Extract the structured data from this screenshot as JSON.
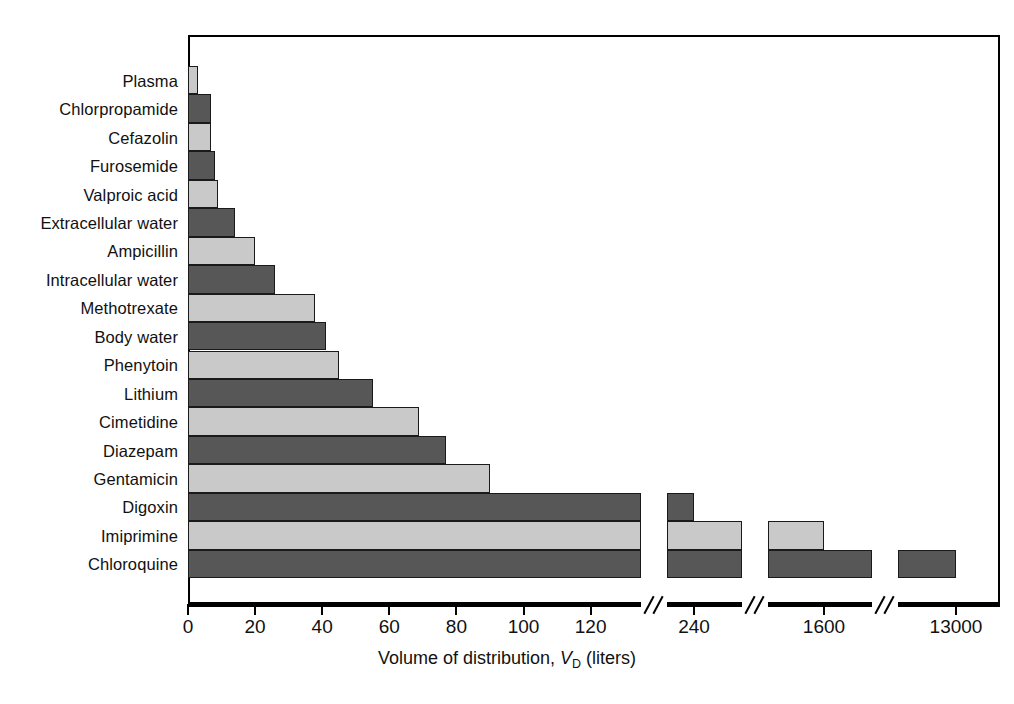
{
  "chart_data": {
    "type": "bar",
    "orientation": "horizontal",
    "title": "",
    "xlabel_parts": {
      "pre": "Volume of distribution, ",
      "symbol": "V",
      "subscript": "D",
      "post": " (liters)"
    },
    "xlabel": "Volume of distribution, VD (liters)",
    "ylabel": "",
    "grid": false,
    "legend": "none",
    "axis_type": "broken-linear",
    "xticks": [
      {
        "label": "0",
        "value": 0
      },
      {
        "label": "20",
        "value": 20
      },
      {
        "label": "40",
        "value": 40
      },
      {
        "label": "60",
        "value": 60
      },
      {
        "label": "80",
        "value": 80
      },
      {
        "label": "100",
        "value": 100
      },
      {
        "label": "120",
        "value": 120
      },
      {
        "label": "240",
        "value": 240
      },
      {
        "label": "1600",
        "value": 1600
      },
      {
        "label": "13000",
        "value": 13000
      }
    ],
    "axis_breaks": [
      135,
      280,
      1800
    ],
    "colors": {
      "dark": "#575757",
      "light": "#c9c9c9",
      "outline": "#1a1a1a",
      "background": "#ffffff"
    },
    "categories": [
      "Plasma",
      "Chlorpropamide",
      "Cefazolin",
      "Furosemide",
      "Valproic acid",
      "Extracellular water",
      "Ampicillin",
      "Intracellular water",
      "Methotrexate",
      "Body water",
      "Phenytoin",
      "Lithium",
      "Cimetidine",
      "Diazepam",
      "Gentamicin",
      "Digoxin",
      "Imiprimine",
      "Chloroquine"
    ],
    "values": [
      3,
      7,
      7,
      8,
      9,
      14,
      20,
      26,
      38,
      41,
      45,
      55,
      69,
      77,
      90,
      240,
      1600,
      13000
    ],
    "shades": [
      "light",
      "dark",
      "light",
      "dark",
      "light",
      "dark",
      "light",
      "dark",
      "light",
      "dark",
      "light",
      "dark",
      "light",
      "dark",
      "light",
      "dark",
      "light",
      "dark"
    ]
  }
}
